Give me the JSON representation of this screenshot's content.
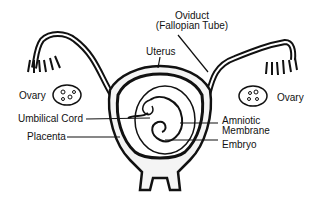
{
  "diagram": {
    "labels": {
      "oviduct_line1": "Oviduct",
      "oviduct_line2": "(Fallopian Tube)",
      "uterus": "Uterus",
      "ovary_left": "Ovary",
      "ovary_right": "Ovary",
      "umbilical_cord": "Umbilical Cord",
      "placenta": "Placenta",
      "amniotic_line1": "Amniotic",
      "amniotic_line2": "Membrane",
      "embryo": "Embryo"
    },
    "colors": {
      "ink": "#111111",
      "background": "#ffffff",
      "fill": "#f4f4f4"
    }
  }
}
